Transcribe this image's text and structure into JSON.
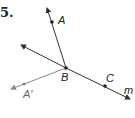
{
  "problem": {
    "number": "5."
  },
  "points": {
    "A": {
      "label": "A",
      "x": 52,
      "y": 22
    },
    "B": {
      "label": "B",
      "x": 66,
      "y": 68
    },
    "C": {
      "label": "C",
      "x": 105,
      "y": 86
    },
    "A_prime": {
      "label": "A'",
      "x": 24,
      "y": 84
    }
  },
  "line": {
    "label": "m"
  },
  "colors": {
    "main": "#333333",
    "reflected": "#888888"
  }
}
